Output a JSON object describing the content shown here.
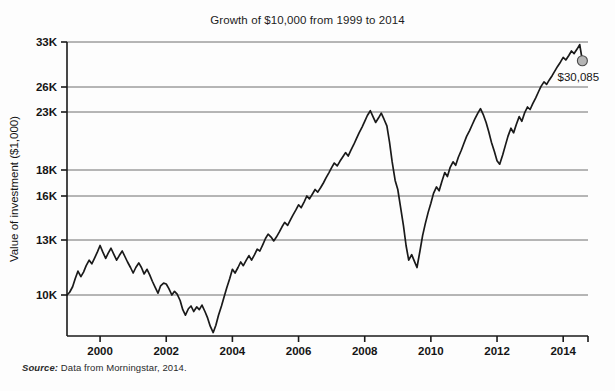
{
  "figure": {
    "title": "Growth of $10,000 from 1999 to 2014",
    "source_strong": "Source:",
    "source_text": "Data from Morningstar, 2014."
  },
  "annotation": {
    "value_label": "$30,085",
    "marker_name": "end-point-marker"
  },
  "chart_data": {
    "type": "line",
    "title": "Growth of $10,000 from 1999 to 2014",
    "xlabel": "",
    "ylabel": "Value of investment ($1,000)",
    "xlim": [
      1999.0,
      2014.75
    ],
    "ylim": [
      7000,
      33700
    ],
    "grid": true,
    "grid_axis": "y",
    "legend": false,
    "line_color": "#1a1a1a",
    "marker_color": "#b5b5b5",
    "xticks": [
      2000,
      2002,
      2004,
      2006,
      2008,
      2010,
      2012,
      2014
    ],
    "xtick_labels": [
      "2000",
      "2002",
      "2004",
      "2006",
      "2008",
      "2010",
      "2012",
      "2014"
    ],
    "yticks": [
      10000,
      13000,
      16000,
      18000,
      23000,
      26000,
      33000
    ],
    "ytick_labels": [
      "10K",
      "13K",
      "16K",
      "18K",
      "23K",
      "26K",
      "33K"
    ],
    "series": [
      {
        "name": "Value of $10,000 investment",
        "x": [
          1999.0,
          1999.08,
          1999.17,
          1999.25,
          1999.33,
          1999.42,
          1999.5,
          1999.58,
          1999.67,
          1999.75,
          1999.83,
          1999.92,
          2000.0,
          2000.08,
          2000.17,
          2000.25,
          2000.33,
          2000.42,
          2000.5,
          2000.58,
          2000.67,
          2000.75,
          2000.83,
          2000.92,
          2001.0,
          2001.08,
          2001.17,
          2001.25,
          2001.33,
          2001.42,
          2001.5,
          2001.58,
          2001.67,
          2001.75,
          2001.83,
          2001.92,
          2002.0,
          2002.08,
          2002.17,
          2002.25,
          2002.33,
          2002.42,
          2002.5,
          2002.58,
          2002.67,
          2002.75,
          2002.83,
          2002.92,
          2003.0,
          2003.08,
          2003.17,
          2003.25,
          2003.33,
          2003.42,
          2003.5,
          2003.58,
          2003.67,
          2003.75,
          2003.83,
          2003.92,
          2004.0,
          2004.08,
          2004.17,
          2004.25,
          2004.33,
          2004.42,
          2004.5,
          2004.58,
          2004.67,
          2004.75,
          2004.83,
          2004.92,
          2005.0,
          2005.08,
          2005.17,
          2005.25,
          2005.33,
          2005.42,
          2005.5,
          2005.58,
          2005.67,
          2005.75,
          2005.83,
          2005.92,
          2006.0,
          2006.08,
          2006.17,
          2006.25,
          2006.33,
          2006.42,
          2006.5,
          2006.58,
          2006.67,
          2006.75,
          2006.83,
          2006.92,
          2007.0,
          2007.08,
          2007.17,
          2007.25,
          2007.33,
          2007.42,
          2007.5,
          2007.58,
          2007.67,
          2007.75,
          2007.83,
          2007.92,
          2008.0,
          2008.08,
          2008.17,
          2008.25,
          2008.33,
          2008.42,
          2008.5,
          2008.58,
          2008.67,
          2008.75,
          2008.83,
          2008.92,
          2009.0,
          2009.08,
          2009.17,
          2009.25,
          2009.33,
          2009.42,
          2009.5,
          2009.58,
          2009.67,
          2009.75,
          2009.83,
          2009.92,
          2010.0,
          2010.08,
          2010.17,
          2010.25,
          2010.33,
          2010.42,
          2010.5,
          2010.58,
          2010.67,
          2010.75,
          2010.83,
          2010.92,
          2011.0,
          2011.08,
          2011.17,
          2011.25,
          2011.33,
          2011.42,
          2011.5,
          2011.58,
          2011.67,
          2011.75,
          2011.83,
          2011.92,
          2012.0,
          2012.08,
          2012.17,
          2012.25,
          2012.33,
          2012.42,
          2012.5,
          2012.58,
          2012.67,
          2012.75,
          2012.83,
          2012.92,
          2013.0,
          2013.08,
          2013.17,
          2013.25,
          2013.33,
          2013.42,
          2013.5,
          2013.58,
          2013.67,
          2013.75,
          2013.83,
          2013.92,
          2014.0,
          2014.08,
          2014.17,
          2014.25,
          2014.33,
          2014.42,
          2014.5,
          2014.58
        ],
        "y": [
          10000,
          10150,
          10450,
          10900,
          11300,
          11000,
          11250,
          11600,
          11900,
          11700,
          12000,
          12350,
          12700,
          12350,
          12000,
          12300,
          12550,
          12200,
          11900,
          12150,
          12400,
          12100,
          11800,
          11500,
          11200,
          11500,
          11750,
          11500,
          11150,
          11400,
          11100,
          10750,
          10400,
          10100,
          10500,
          10650,
          10600,
          10350,
          10000,
          10200,
          10050,
          9700,
          9200,
          8900,
          9250,
          9400,
          9100,
          9350,
          9200,
          9450,
          9100,
          8750,
          8300,
          7950,
          8350,
          8900,
          9400,
          9900,
          10400,
          10900,
          11400,
          11200,
          11500,
          11800,
          11600,
          11900,
          12150,
          11900,
          12200,
          12500,
          12400,
          12750,
          13100,
          13400,
          13200,
          12950,
          13200,
          13550,
          13900,
          14200,
          14000,
          14350,
          14700,
          15050,
          15400,
          15200,
          15600,
          16000,
          15800,
          16150,
          16500,
          16300,
          16650,
          17000,
          17400,
          17800,
          18200,
          18600,
          18350,
          18750,
          19100,
          19500,
          19200,
          19700,
          20200,
          20700,
          21200,
          21700,
          22200,
          22700,
          23150,
          22600,
          22100,
          22500,
          22900,
          22400,
          21800,
          20400,
          18700,
          17200,
          16500,
          15300,
          14000,
          12700,
          11900,
          12200,
          11850,
          11500,
          12400,
          13300,
          14100,
          14900,
          15500,
          16200,
          16700,
          16400,
          17100,
          17800,
          17500,
          18200,
          18700,
          18400,
          19100,
          19700,
          20300,
          20900,
          21400,
          21900,
          22400,
          22900,
          23400,
          22800,
          22100,
          21300,
          20400,
          19600,
          18800,
          18500,
          19300,
          20100,
          20900,
          21600,
          21200,
          21900,
          22600,
          22200,
          22900,
          23600,
          23300,
          24000,
          24700,
          25400,
          26100,
          26800,
          26400,
          27100,
          27800,
          28500,
          29200,
          29900,
          30600,
          30200,
          30900,
          31600,
          31200,
          31900,
          32600,
          30085
        ]
      }
    ],
    "annotations": [
      {
        "text": "$30,085",
        "x": 2014.58,
        "y": 30085,
        "marker": "circle"
      }
    ]
  }
}
